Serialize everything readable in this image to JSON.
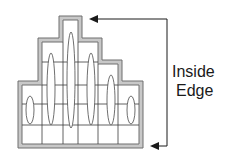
{
  "diagram": {
    "type": "stepped-coil-cross-section",
    "label_line1": "Inside",
    "label_line2": "Edge",
    "colors": {
      "background": "#ffffff",
      "outline_outer": "#6e6e6e",
      "outline_fill": "#c8c8c8",
      "grid": "#3a3a3a",
      "ellipse": "#4a4a4a",
      "arrow": "#1a1a1a",
      "text": "#1a1a1a"
    },
    "columns": 6,
    "rows": 5
  }
}
